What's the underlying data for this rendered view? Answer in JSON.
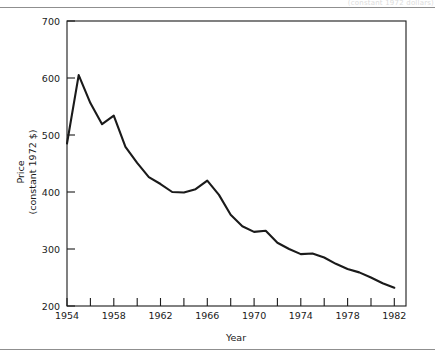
{
  "figure": {
    "background_color": "#ffffff",
    "line_color": "#1a1a1a",
    "axis_color": "#1a1a1a",
    "rule_color": "#8f8f8f",
    "ghost_caption": "(constant 1972 dollars)"
  },
  "chart_data": {
    "type": "line",
    "title": "",
    "xlabel": "Year",
    "ylabel": "Price\n(constant 1972 $)",
    "ylabel_line1": "Price",
    "ylabel_line2": "(constant 1972 $)",
    "xlim": [
      1954,
      1983
    ],
    "ylim": [
      200,
      700
    ],
    "grid": false,
    "legend": null,
    "y_ticks": [
      200,
      300,
      400,
      500,
      600,
      700
    ],
    "y_tick_labels": [
      "200",
      "300",
      "400",
      "500",
      "600",
      "700"
    ],
    "x_ticks": [
      1954,
      1956,
      1958,
      1960,
      1962,
      1964,
      1966,
      1968,
      1970,
      1972,
      1974,
      1976,
      1978,
      1980,
      1982
    ],
    "x_tick_labels": [
      "1954",
      "",
      "1958",
      "",
      "1962",
      "",
      "1966",
      "",
      "1970",
      "",
      "1974",
      "",
      "1978",
      "",
      "1982"
    ],
    "x_major_labels": [
      "1954",
      "1958",
      "1962",
      "1966",
      "1970",
      "1974",
      "1978",
      "1982"
    ],
    "series": [
      {
        "name": "Price (constant 1972 $)",
        "x": [
          1954,
          1955,
          1956,
          1957,
          1958,
          1959,
          1960,
          1961,
          1962,
          1963,
          1964,
          1965,
          1966,
          1967,
          1968,
          1969,
          1970,
          1971,
          1972,
          1973,
          1974,
          1975,
          1976,
          1977,
          1978,
          1979,
          1980,
          1981,
          1982
        ],
        "values": [
          485,
          605,
          556,
          519,
          534,
          479,
          451,
          426,
          414,
          400,
          399,
          405,
          420,
          395,
          360,
          340,
          330,
          332,
          311,
          300,
          291,
          292,
          285,
          274,
          265,
          259,
          250,
          240,
          232
        ]
      }
    ]
  }
}
